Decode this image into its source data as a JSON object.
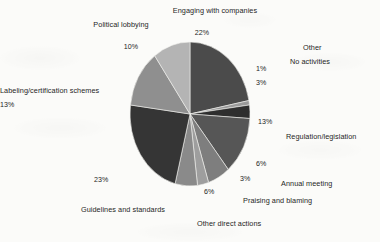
{
  "chart_data": {
    "type": "pie",
    "title": "",
    "xlabel": "",
    "ylabel": "",
    "legend_position": "none",
    "grid": false,
    "units": "percent",
    "total": 100,
    "categories": [
      "Engaging with companies",
      "Other",
      "No activities",
      "Regulation/legislation",
      "Annual meeting",
      "Praising and blaming",
      "Other direct actions",
      "Guidelines and standards",
      "Labeling/certification schemes",
      "Political lobbying"
    ],
    "values": [
      22,
      1,
      3,
      13,
      6,
      3,
      6,
      23,
      13,
      10
    ],
    "value_labels": [
      "22%",
      "1%",
      "3%",
      "13%",
      "6%",
      "3%",
      "6%",
      "23%",
      "13%",
      "10%"
    ],
    "colors": [
      "#4b4b4b",
      "#9a9a9a",
      "#2e2e2e",
      "#565656",
      "#7e7e7e",
      "#9e9e9e",
      "#8a8a8a",
      "#353535",
      "#8f8f8f",
      "#b4b4b4"
    ],
    "slices": [
      {
        "label": "Engaging with companies",
        "value": 22,
        "value_label": "22%",
        "color": "#4b4b4b",
        "start_pct": 0,
        "end_pct": 22
      },
      {
        "label": "Other",
        "value": 1,
        "value_label": "1%",
        "color": "#9a9a9a",
        "start_pct": 22,
        "end_pct": 23
      },
      {
        "label": "No activities",
        "value": 3,
        "value_label": "3%",
        "color": "#2e2e2e",
        "start_pct": 23,
        "end_pct": 26
      },
      {
        "label": "Regulation/legislation",
        "value": 13,
        "value_label": "13%",
        "color": "#565656",
        "start_pct": 26,
        "end_pct": 39
      },
      {
        "label": "Annual meeting",
        "value": 6,
        "value_label": "6%",
        "color": "#7e7e7e",
        "start_pct": 39,
        "end_pct": 45
      },
      {
        "label": "Praising and blaming",
        "value": 3,
        "value_label": "3%",
        "color": "#9e9e9e",
        "start_pct": 45,
        "end_pct": 48
      },
      {
        "label": "Other direct actions",
        "value": 6,
        "value_label": "6%",
        "color": "#8a8a8a",
        "start_pct": 48,
        "end_pct": 54
      },
      {
        "label": "Guidelines and standards",
        "value": 23,
        "value_label": "23%",
        "color": "#353535",
        "start_pct": 54,
        "end_pct": 77
      },
      {
        "label": "Labeling/certification schemes",
        "value": 13,
        "value_label": "13%",
        "color": "#8f8f8f",
        "start_pct": 77,
        "end_pct": 90
      },
      {
        "label": "Political lobbying",
        "value": 10,
        "value_label": "10%",
        "color": "#b4b4b4",
        "start_pct": 90,
        "end_pct": 100
      }
    ]
  },
  "labels": {
    "engaging_with_companies": "Engaging with companies",
    "engaging_with_companies_pct": "22%",
    "other": "Other",
    "other_pct": "1%",
    "no_activities": "No activities",
    "no_activities_pct": "3%",
    "regulation_legislation": "Regulation/legislation",
    "regulation_legislation_pct": "13%",
    "annual_meeting": "Annual meeting",
    "annual_meeting_pct": "6%",
    "praising_and_blaming": "Praising and blaming",
    "praising_and_blaming_pct": "3%",
    "other_direct_actions": "Other direct actions",
    "other_direct_actions_pct": "6%",
    "guidelines_and_standards": "Guidelines and standards",
    "guidelines_and_standards_pct": "23%",
    "labeling_certification_schemes": "Labeling/certification schemes",
    "labeling_certification_schemes_pct": "13%",
    "political_lobbying": "Political lobbying",
    "political_lobbying_pct": "10%"
  }
}
